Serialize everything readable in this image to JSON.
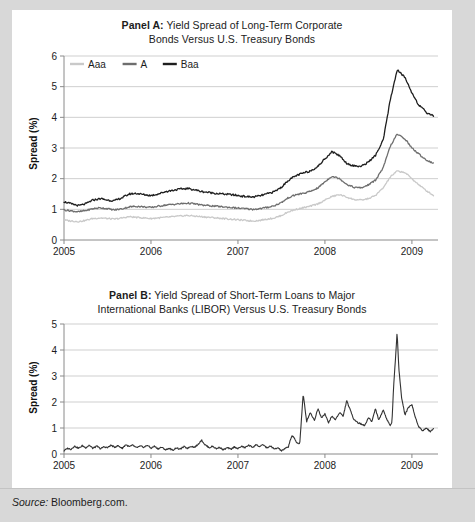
{
  "figure": {
    "source_label": "Source:",
    "source_text": "Bloomberg.com."
  },
  "panel_a": {
    "title_lead": "Panel A:",
    "title_rest": " Yield Spread of Long-Term Corporate",
    "title_line2": "Bonds Versus U.S. Treasury Bonds",
    "ylabel": "Spread (%)"
  },
  "panel_b": {
    "title_lead": "Panel B:",
    "title_rest": " Yield Spread of Short-Term Loans to Major",
    "title_line2": "International Banks (LIBOR) Versus U.S. Treasury Bonds",
    "ylabel": "Spread (%)"
  },
  "chart_data": [
    {
      "id": "panel-a",
      "type": "line",
      "title": "Panel A: Yield Spread of Long-Term Corporate Bonds Versus U.S. Treasury Bonds",
      "xlabel": "",
      "ylabel": "Spread (%)",
      "xlim": [
        2005.0,
        2009.3
      ],
      "ylim": [
        0,
        6
      ],
      "yticks": [
        0,
        1,
        2,
        3,
        4,
        5,
        6
      ],
      "xticks": [
        2005,
        2006,
        2007,
        2008,
        2009
      ],
      "xtick_labels": [
        "2005",
        "2006",
        "2007",
        "2008",
        "2009"
      ],
      "grid": "horizontal",
      "legend_position": "top-left-inside",
      "colors": {
        "Aaa": "#c9c9c9",
        "A": "#6e6e6e",
        "Baa": "#1e1e1e"
      },
      "series": [
        {
          "name": "Aaa",
          "color": "#c9c9c9",
          "x": [
            2005.0,
            2005.08,
            2005.17,
            2005.25,
            2005.33,
            2005.42,
            2005.5,
            2005.58,
            2005.67,
            2005.75,
            2005.83,
            2005.92,
            2006.0,
            2006.08,
            2006.17,
            2006.25,
            2006.33,
            2006.42,
            2006.5,
            2006.58,
            2006.67,
            2006.75,
            2006.83,
            2006.92,
            2007.0,
            2007.08,
            2007.17,
            2007.25,
            2007.33,
            2007.42,
            2007.5,
            2007.58,
            2007.67,
            2007.75,
            2007.83,
            2007.92,
            2008.0,
            2008.08,
            2008.17,
            2008.25,
            2008.33,
            2008.42,
            2008.5,
            2008.58,
            2008.67,
            2008.75,
            2008.83,
            2008.92,
            2009.0,
            2009.08,
            2009.17,
            2009.25
          ],
          "y": [
            0.65,
            0.62,
            0.6,
            0.64,
            0.7,
            0.72,
            0.7,
            0.68,
            0.72,
            0.76,
            0.74,
            0.72,
            0.7,
            0.72,
            0.74,
            0.76,
            0.78,
            0.8,
            0.78,
            0.76,
            0.74,
            0.72,
            0.7,
            0.68,
            0.66,
            0.64,
            0.62,
            0.64,
            0.68,
            0.72,
            0.8,
            0.92,
            1.0,
            1.05,
            1.1,
            1.18,
            1.3,
            1.42,
            1.48,
            1.4,
            1.32,
            1.3,
            1.35,
            1.45,
            1.7,
            2.05,
            2.25,
            2.2,
            2.0,
            1.8,
            1.6,
            1.45
          ]
        },
        {
          "name": "A",
          "color": "#6e6e6e",
          "x": [
            2005.0,
            2005.08,
            2005.17,
            2005.25,
            2005.33,
            2005.42,
            2005.5,
            2005.58,
            2005.67,
            2005.75,
            2005.83,
            2005.92,
            2006.0,
            2006.08,
            2006.17,
            2006.25,
            2006.33,
            2006.42,
            2006.5,
            2006.58,
            2006.67,
            2006.75,
            2006.83,
            2006.92,
            2007.0,
            2007.08,
            2007.17,
            2007.25,
            2007.33,
            2007.42,
            2007.5,
            2007.58,
            2007.67,
            2007.75,
            2007.83,
            2007.92,
            2008.0,
            2008.08,
            2008.17,
            2008.25,
            2008.33,
            2008.42,
            2008.5,
            2008.58,
            2008.67,
            2008.75,
            2008.83,
            2008.92,
            2009.0,
            2009.08,
            2009.17,
            2009.25
          ],
          "y": [
            0.98,
            0.95,
            0.92,
            0.96,
            1.02,
            1.05,
            1.02,
            0.98,
            1.02,
            1.08,
            1.1,
            1.08,
            1.06,
            1.1,
            1.14,
            1.16,
            1.18,
            1.2,
            1.18,
            1.14,
            1.12,
            1.1,
            1.08,
            1.06,
            1.04,
            1.02,
            1.0,
            1.02,
            1.06,
            1.12,
            1.22,
            1.38,
            1.48,
            1.52,
            1.58,
            1.7,
            1.9,
            2.08,
            2.0,
            1.82,
            1.72,
            1.7,
            1.8,
            1.95,
            2.35,
            3.05,
            3.45,
            3.3,
            3.0,
            2.8,
            2.6,
            2.5
          ]
        },
        {
          "name": "Baa",
          "color": "#1e1e1e",
          "x": [
            2005.0,
            2005.08,
            2005.17,
            2005.25,
            2005.33,
            2005.42,
            2005.5,
            2005.58,
            2005.67,
            2005.75,
            2005.83,
            2005.92,
            2006.0,
            2006.08,
            2006.17,
            2006.25,
            2006.33,
            2006.42,
            2006.5,
            2006.58,
            2006.67,
            2006.75,
            2006.83,
            2006.92,
            2007.0,
            2007.08,
            2007.17,
            2007.25,
            2007.33,
            2007.42,
            2007.5,
            2007.58,
            2007.67,
            2007.75,
            2007.83,
            2007.92,
            2008.0,
            2008.08,
            2008.17,
            2008.25,
            2008.33,
            2008.42,
            2008.5,
            2008.58,
            2008.67,
            2008.75,
            2008.83,
            2008.92,
            2009.0,
            2009.08,
            2009.17,
            2009.25
          ],
          "y": [
            1.25,
            1.18,
            1.12,
            1.18,
            1.3,
            1.35,
            1.3,
            1.28,
            1.38,
            1.5,
            1.52,
            1.48,
            1.45,
            1.5,
            1.58,
            1.62,
            1.66,
            1.68,
            1.64,
            1.58,
            1.55,
            1.52,
            1.5,
            1.48,
            1.45,
            1.42,
            1.4,
            1.44,
            1.5,
            1.58,
            1.72,
            1.95,
            2.1,
            2.18,
            2.25,
            2.4,
            2.65,
            2.88,
            2.75,
            2.5,
            2.42,
            2.4,
            2.55,
            2.75,
            3.25,
            4.55,
            5.55,
            5.3,
            4.8,
            4.4,
            4.15,
            4.05
          ]
        }
      ]
    },
    {
      "id": "panel-b",
      "type": "line",
      "title": "Panel B: Yield Spread of Short-Term Loans to Major International Banks (LIBOR) Versus U.S. Treasury Bonds",
      "xlabel": "",
      "ylabel": "Spread (%)",
      "xlim": [
        2005.0,
        2009.3
      ],
      "ylim": [
        0,
        5
      ],
      "yticks": [
        0,
        1,
        2,
        3,
        4,
        5
      ],
      "xticks": [
        2005,
        2006,
        2007,
        2008,
        2009
      ],
      "xtick_labels": [
        "2005",
        "2006",
        "2007",
        "2008",
        "2009"
      ],
      "grid": "horizontal",
      "legend_position": "none",
      "colors": {
        "LIBOR": "#333333"
      },
      "series": [
        {
          "name": "LIBOR spread",
          "color": "#333333",
          "x": [
            2005.0,
            2005.04,
            2005.08,
            2005.12,
            2005.17,
            2005.21,
            2005.25,
            2005.29,
            2005.33,
            2005.38,
            2005.42,
            2005.46,
            2005.5,
            2005.54,
            2005.58,
            2005.62,
            2005.67,
            2005.71,
            2005.75,
            2005.79,
            2005.83,
            2005.88,
            2005.92,
            2005.96,
            2006.0,
            2006.04,
            2006.08,
            2006.12,
            2006.17,
            2006.21,
            2006.25,
            2006.29,
            2006.33,
            2006.38,
            2006.42,
            2006.46,
            2006.5,
            2006.54,
            2006.58,
            2006.62,
            2006.67,
            2006.71,
            2006.75,
            2006.79,
            2006.83,
            2006.88,
            2006.92,
            2006.96,
            2007.0,
            2007.04,
            2007.08,
            2007.12,
            2007.17,
            2007.21,
            2007.25,
            2007.29,
            2007.33,
            2007.38,
            2007.42,
            2007.46,
            2007.5,
            2007.54,
            2007.58,
            2007.6,
            2007.62,
            2007.65,
            2007.67,
            2007.71,
            2007.75,
            2007.79,
            2007.83,
            2007.88,
            2007.92,
            2007.96,
            2008.0,
            2008.04,
            2008.08,
            2008.12,
            2008.17,
            2008.21,
            2008.25,
            2008.29,
            2008.33,
            2008.38,
            2008.42,
            2008.46,
            2008.5,
            2008.54,
            2008.58,
            2008.62,
            2008.67,
            2008.71,
            2008.75,
            2008.77,
            2008.79,
            2008.81,
            2008.83,
            2008.85,
            2008.88,
            2008.92,
            2008.96,
            2009.0,
            2009.04,
            2009.08,
            2009.12,
            2009.17,
            2009.21,
            2009.25
          ],
          "y": [
            0.12,
            0.22,
            0.18,
            0.3,
            0.22,
            0.32,
            0.24,
            0.34,
            0.22,
            0.3,
            0.2,
            0.28,
            0.24,
            0.34,
            0.26,
            0.32,
            0.22,
            0.36,
            0.28,
            0.34,
            0.24,
            0.3,
            0.26,
            0.34,
            0.22,
            0.3,
            0.2,
            0.26,
            0.16,
            0.22,
            0.14,
            0.24,
            0.18,
            0.28,
            0.22,
            0.3,
            0.26,
            0.36,
            0.54,
            0.36,
            0.24,
            0.3,
            0.2,
            0.26,
            0.16,
            0.24,
            0.18,
            0.28,
            0.2,
            0.3,
            0.24,
            0.34,
            0.26,
            0.36,
            0.28,
            0.36,
            0.24,
            0.3,
            0.18,
            0.24,
            0.12,
            0.2,
            0.28,
            0.52,
            0.7,
            0.6,
            0.46,
            0.38,
            2.3,
            1.25,
            1.6,
            1.3,
            1.75,
            1.4,
            1.55,
            1.2,
            1.45,
            1.32,
            1.6,
            1.45,
            2.05,
            1.7,
            1.35,
            1.2,
            1.15,
            1.1,
            1.4,
            1.25,
            1.75,
            1.3,
            1.7,
            1.35,
            1.1,
            1.2,
            2.6,
            3.6,
            4.7,
            3.3,
            2.2,
            1.5,
            1.8,
            1.9,
            1.4,
            1.05,
            0.9,
            1.0,
            0.85,
            1.0
          ]
        }
      ]
    }
  ]
}
